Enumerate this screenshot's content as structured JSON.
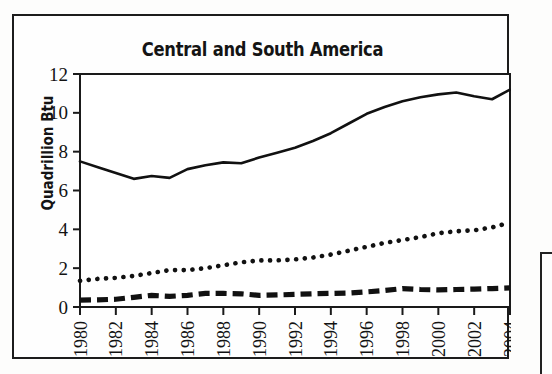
{
  "figure": {
    "title": "Central and South America",
    "y_axis_title": "Quadrillion Btu"
  },
  "chart_data": {
    "type": "line",
    "title": "Central and South America",
    "xlabel": "",
    "ylabel": "Quadrillion Btu",
    "xlim": [
      1980,
      2004
    ],
    "ylim": [
      0,
      12
    ],
    "yticks": [
      0,
      2,
      4,
      6,
      8,
      10,
      12
    ],
    "ytick_labels": [
      "0",
      "2",
      "4",
      "6",
      "8",
      "10",
      "12"
    ],
    "x": [
      1980,
      1981,
      1982,
      1983,
      1984,
      1985,
      1986,
      1987,
      1988,
      1989,
      1990,
      1991,
      1992,
      1993,
      1994,
      1995,
      1996,
      1997,
      1998,
      1999,
      2000,
      2001,
      2002,
      2003,
      2004
    ],
    "xtick_labels": [
      "1980",
      "1982",
      "1984",
      "1986",
      "1988",
      "1990",
      "1992",
      "1994",
      "1996",
      "1998",
      "2000",
      "2002",
      "2004"
    ],
    "xtick_values": [
      1980,
      1982,
      1984,
      1986,
      1988,
      1990,
      1992,
      1994,
      1996,
      1998,
      2000,
      2002,
      2004
    ],
    "grid": false,
    "legend_position": "none",
    "series": [
      {
        "name": "solid-series",
        "style": "solid",
        "color": "#111111",
        "values": [
          7.5,
          7.2,
          6.9,
          6.6,
          6.75,
          6.65,
          7.1,
          7.3,
          7.45,
          7.4,
          7.7,
          7.95,
          8.2,
          8.55,
          8.95,
          9.45,
          9.95,
          10.3,
          10.6,
          10.8,
          10.95,
          11.05,
          10.85,
          10.7,
          11.2
        ]
      },
      {
        "name": "dotted-series",
        "style": "dotted",
        "color": "#111111",
        "values": [
          1.35,
          1.45,
          1.5,
          1.6,
          1.75,
          1.9,
          1.9,
          2.0,
          2.15,
          2.3,
          2.4,
          2.4,
          2.45,
          2.55,
          2.7,
          2.9,
          3.1,
          3.3,
          3.45,
          3.6,
          3.8,
          3.9,
          3.95,
          4.1,
          4.35
        ]
      },
      {
        "name": "dashed-series",
        "style": "dashed",
        "color": "#111111",
        "values": [
          0.35,
          0.37,
          0.4,
          0.5,
          0.6,
          0.55,
          0.6,
          0.7,
          0.7,
          0.68,
          0.6,
          0.62,
          0.65,
          0.68,
          0.7,
          0.72,
          0.78,
          0.85,
          0.95,
          0.9,
          0.88,
          0.9,
          0.92,
          0.95,
          0.98
        ]
      }
    ]
  }
}
